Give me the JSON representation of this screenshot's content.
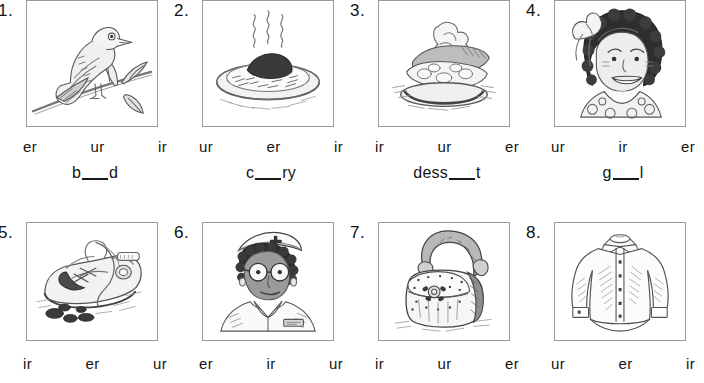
{
  "worksheet": {
    "title": "er / ur / ir phonics worksheet",
    "blank_marker": "___",
    "rows": [
      {
        "row_id": "row-1",
        "items": [
          {
            "number": "1.",
            "picture": "bird-on-branch",
            "picture_label": "bird perched on a branch with leaves",
            "options": [
              "er",
              "ur",
              "ir"
            ],
            "word_before": "b",
            "word_after": "d",
            "word": "b___d"
          },
          {
            "number": "2.",
            "picture": "plate-of-curry",
            "picture_label": "steaming plate of curry and rice",
            "options": [
              "ur",
              "er",
              "ir"
            ],
            "word_before": "c",
            "word_after": "ry",
            "word": "c___ry"
          },
          {
            "number": "3.",
            "picture": "slice-of-cake",
            "picture_label": "slice of cake with whipped cream on a plate",
            "options": [
              "ir",
              "ur",
              "er"
            ],
            "word_before": "dess",
            "word_after": "t",
            "word": "dess___t"
          },
          {
            "number": "4.",
            "picture": "girl-with-bow",
            "picture_label": "smiling girl with curly hair and a hair bow",
            "options": [
              "ur",
              "ir",
              "er"
            ],
            "word_before": "g",
            "word_after": "l",
            "word": "g___l"
          }
        ]
      },
      {
        "row_id": "row-2",
        "items": [
          {
            "number": "5.",
            "picture": "muddy-shoe",
            "picture_label": "dirty sneaker with mud",
            "options": [
              "ir",
              "er",
              "ur"
            ],
            "word_before": "",
            "word_after": "",
            "word": ""
          },
          {
            "number": "6.",
            "picture": "nurse",
            "picture_label": "nurse wearing cap and glasses",
            "options": [
              "er",
              "ir",
              "ur"
            ],
            "word_before": "",
            "word_after": "",
            "word": ""
          },
          {
            "number": "7.",
            "picture": "purse",
            "picture_label": "handbag purse with strap and flower clasp",
            "options": [
              "ir",
              "ur",
              "er"
            ],
            "word_before": "",
            "word_after": "",
            "word": ""
          },
          {
            "number": "8.",
            "picture": "shirt",
            "picture_label": "long sleeved button up shirt",
            "options": [
              "ur",
              "er",
              "ir"
            ],
            "word_before": "",
            "word_after": "",
            "word": ""
          }
        ]
      }
    ]
  },
  "colors": {
    "ink": "#151515",
    "box_border": "#9a9a9a",
    "page_background": "#ffffff",
    "line_art": "#4a4a4a"
  }
}
